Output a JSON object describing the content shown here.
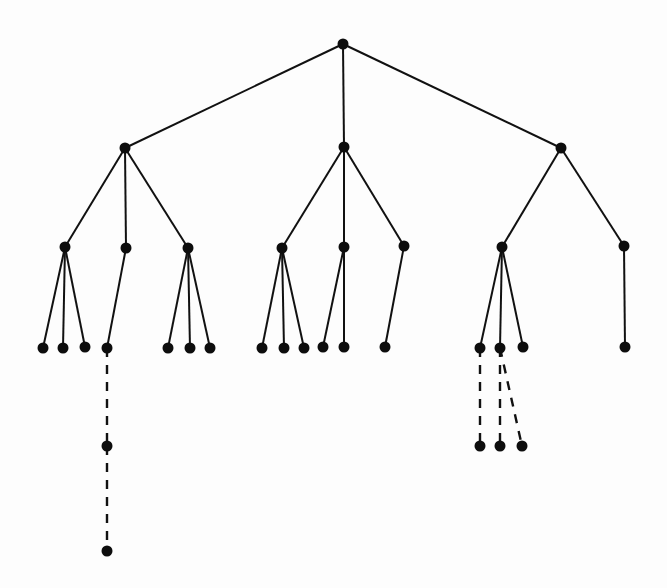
{
  "diagram": {
    "type": "tree",
    "colors": {
      "background": "#fdfdfd",
      "ink": "#111111"
    },
    "node_radius": 5.5,
    "nodes": [
      {
        "id": "r",
        "x": 343,
        "y": 44
      },
      {
        "id": "a",
        "x": 125,
        "y": 148
      },
      {
        "id": "b",
        "x": 344,
        "y": 147
      },
      {
        "id": "c",
        "x": 561,
        "y": 148
      },
      {
        "id": "a1",
        "x": 65,
        "y": 247
      },
      {
        "id": "a2",
        "x": 126,
        "y": 248
      },
      {
        "id": "a3",
        "x": 188,
        "y": 248
      },
      {
        "id": "b1",
        "x": 282,
        "y": 248
      },
      {
        "id": "b2",
        "x": 344,
        "y": 247
      },
      {
        "id": "b3",
        "x": 404,
        "y": 246
      },
      {
        "id": "c1",
        "x": 502,
        "y": 247
      },
      {
        "id": "c2",
        "x": 624,
        "y": 246
      },
      {
        "id": "a1a",
        "x": 43,
        "y": 348
      },
      {
        "id": "a1b",
        "x": 63,
        "y": 348
      },
      {
        "id": "a1c",
        "x": 85,
        "y": 347
      },
      {
        "id": "a2a",
        "x": 107,
        "y": 348
      },
      {
        "id": "a3a",
        "x": 168,
        "y": 348
      },
      {
        "id": "a3b",
        "x": 190,
        "y": 348
      },
      {
        "id": "a3c",
        "x": 210,
        "y": 348
      },
      {
        "id": "b1a",
        "x": 262,
        "y": 348
      },
      {
        "id": "b1b",
        "x": 284,
        "y": 348
      },
      {
        "id": "b1c",
        "x": 304,
        "y": 348
      },
      {
        "id": "b2a",
        "x": 323,
        "y": 347
      },
      {
        "id": "b2b",
        "x": 344,
        "y": 347
      },
      {
        "id": "b3a",
        "x": 385,
        "y": 347
      },
      {
        "id": "c1a",
        "x": 480,
        "y": 348
      },
      {
        "id": "c1b",
        "x": 500,
        "y": 348
      },
      {
        "id": "c1c",
        "x": 523,
        "y": 347
      },
      {
        "id": "c2a",
        "x": 625,
        "y": 347
      },
      {
        "id": "a2a1",
        "x": 107,
        "y": 446
      },
      {
        "id": "a2a2",
        "x": 107,
        "y": 551
      },
      {
        "id": "c1a1",
        "x": 480,
        "y": 446
      },
      {
        "id": "c1b1",
        "x": 500,
        "y": 446
      },
      {
        "id": "c1b2",
        "x": 522,
        "y": 446
      }
    ],
    "edges": [
      {
        "from": "r",
        "to": "a",
        "style": "solid"
      },
      {
        "from": "r",
        "to": "b",
        "style": "solid"
      },
      {
        "from": "r",
        "to": "c",
        "style": "solid"
      },
      {
        "from": "a",
        "to": "a1",
        "style": "solid"
      },
      {
        "from": "a",
        "to": "a2",
        "style": "solid"
      },
      {
        "from": "a",
        "to": "a3",
        "style": "solid"
      },
      {
        "from": "b",
        "to": "b1",
        "style": "solid"
      },
      {
        "from": "b",
        "to": "b2",
        "style": "solid"
      },
      {
        "from": "b",
        "to": "b3",
        "style": "solid"
      },
      {
        "from": "c",
        "to": "c1",
        "style": "solid"
      },
      {
        "from": "c",
        "to": "c2",
        "style": "solid"
      },
      {
        "from": "a1",
        "to": "a1a",
        "style": "solid"
      },
      {
        "from": "a1",
        "to": "a1b",
        "style": "solid"
      },
      {
        "from": "a1",
        "to": "a1c",
        "style": "solid"
      },
      {
        "from": "a2",
        "to": "a2a",
        "style": "solid"
      },
      {
        "from": "a3",
        "to": "a3a",
        "style": "solid"
      },
      {
        "from": "a3",
        "to": "a3b",
        "style": "solid"
      },
      {
        "from": "a3",
        "to": "a3c",
        "style": "solid"
      },
      {
        "from": "b1",
        "to": "b1a",
        "style": "solid"
      },
      {
        "from": "b1",
        "to": "b1b",
        "style": "solid"
      },
      {
        "from": "b1",
        "to": "b1c",
        "style": "solid"
      },
      {
        "from": "b2",
        "to": "b2a",
        "style": "solid"
      },
      {
        "from": "b2",
        "to": "b2b",
        "style": "solid"
      },
      {
        "from": "b3",
        "to": "b3a",
        "style": "solid"
      },
      {
        "from": "c1",
        "to": "c1a",
        "style": "solid"
      },
      {
        "from": "c1",
        "to": "c1b",
        "style": "solid"
      },
      {
        "from": "c1",
        "to": "c1c",
        "style": "solid"
      },
      {
        "from": "c2",
        "to": "c2a",
        "style": "solid"
      },
      {
        "from": "a2a",
        "to": "a2a1",
        "style": "dashed"
      },
      {
        "from": "a2a1",
        "to": "a2a2",
        "style": "dashed"
      },
      {
        "from": "c1a",
        "to": "c1a1",
        "style": "dashed"
      },
      {
        "from": "c1b",
        "to": "c1b1",
        "style": "dashed"
      },
      {
        "from": "c1b",
        "to": "c1b2",
        "style": "dashed"
      }
    ]
  }
}
